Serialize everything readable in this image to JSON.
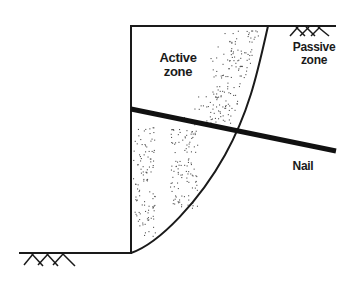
{
  "diagram": {
    "type": "soil-nail-wall-cross-section",
    "labels": {
      "active_zone": [
        "Active",
        "zone"
      ],
      "passive_zone": [
        "Passive",
        "zone"
      ],
      "nail": "Nail"
    },
    "colors": {
      "line": "#1a1a1a",
      "stipple": "#555555",
      "background": "#ffffff"
    },
    "elements": [
      "wall-face",
      "top-ground-surface",
      "bottom-ground-surface",
      "failure-surface-curve",
      "nail",
      "ground-hatch-top-right",
      "ground-hatch-bottom-left",
      "active-zone-stipple"
    ]
  }
}
